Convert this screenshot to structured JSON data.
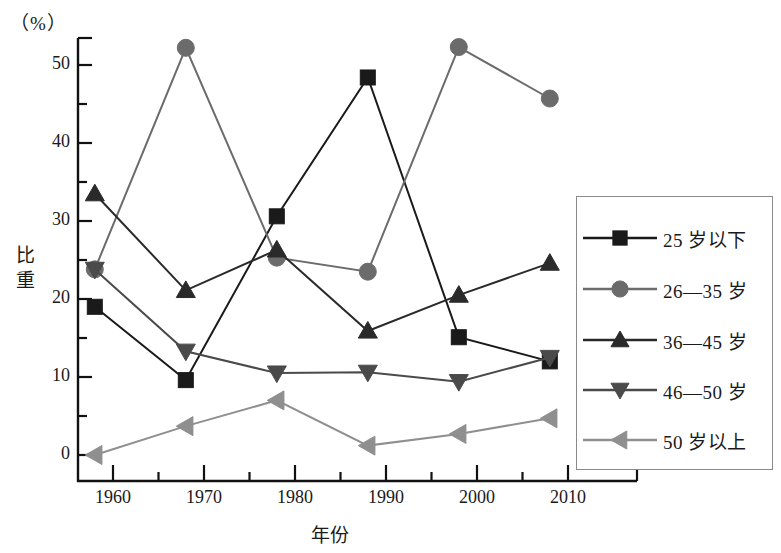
{
  "chart_data": {
    "type": "line",
    "title": "",
    "xlabel": "年份",
    "ylabel": "比重",
    "unit_label": "（%）",
    "xlim": [
      1956,
      2013
    ],
    "ylim": [
      -2,
      55
    ],
    "grid": false,
    "legend_position": "right",
    "x": [
      1958,
      1968,
      1978,
      1988,
      1998,
      2008
    ],
    "xticks": [
      1960,
      1970,
      1980,
      1990,
      2000,
      2010
    ],
    "xtick_labels": [
      "1960",
      "1970",
      "1980",
      "1990",
      "2000",
      "2010"
    ],
    "x_minor_ticks": [
      1965,
      1975,
      1985,
      1995,
      2005
    ],
    "yticks": [
      0,
      10,
      20,
      30,
      40,
      50
    ],
    "ytick_labels": [
      "0",
      "10",
      "20",
      "30",
      "40",
      "50"
    ],
    "y_minor_ticks": [
      5,
      15,
      25,
      35,
      45
    ],
    "series": [
      {
        "name": "25 岁以下",
        "marker": "square",
        "color": "#1a1a1a",
        "values": [
          19.0,
          9.6,
          30.6,
          48.4,
          15.1,
          12.0
        ]
      },
      {
        "name": "26—35 岁",
        "marker": "circle",
        "color": "#6b6b6b",
        "values": [
          23.8,
          52.2,
          25.3,
          23.5,
          52.3,
          45.7
        ]
      },
      {
        "name": "36—45 岁",
        "marker": "triangle-up",
        "color": "#2a2a2a",
        "values": [
          33.5,
          21.1,
          26.3,
          15.9,
          20.5,
          24.6
        ]
      },
      {
        "name": "46—50 岁",
        "marker": "triangle-down",
        "color": "#4a4a4a",
        "values": [
          23.8,
          13.3,
          10.5,
          10.6,
          9.4,
          12.5
        ]
      },
      {
        "name": "50 岁以上",
        "marker": "triangle-left",
        "color": "#8f8f8f",
        "values": [
          0.0,
          3.7,
          7.0,
          1.2,
          2.7,
          4.7
        ]
      }
    ]
  },
  "legend": {
    "entries": [
      {
        "label": "25 岁以下"
      },
      {
        "label": "26—35 岁"
      },
      {
        "label": "36—45 岁"
      },
      {
        "label": "46—50 岁"
      },
      {
        "label": "50 岁以上"
      }
    ]
  }
}
